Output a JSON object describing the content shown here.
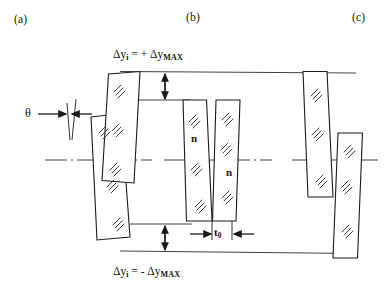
{
  "figure": {
    "kind": "technical-line-diagram",
    "background": "#ffffff",
    "line_color": "#1a1a1a"
  },
  "panels": [
    {
      "id": "a",
      "label": "(a)",
      "x": 14,
      "y": 14
    },
    {
      "id": "b",
      "label": "(b)",
      "x": 186,
      "y": 12
    },
    {
      "id": "c",
      "label": "(c)",
      "x": 352,
      "y": 12
    }
  ],
  "annotations": {
    "top_equation": {
      "text": "Δyi = + ΔyMAX",
      "delta": "Δ",
      "y_sym": "y",
      "sub_i": "i",
      "equals": "=",
      "sign": "+",
      "sub_max": "MAX",
      "x": 113,
      "y": 50
    },
    "bottom_equation": {
      "text": "Δyi = - ΔyMAX",
      "delta": "Δ",
      "y_sym": "y",
      "sub_i": "i",
      "equals": "=",
      "sign": "-",
      "sub_max": "MAX",
      "x": 113,
      "y": 267
    },
    "theta": {
      "symbol": "θ",
      "x": 27,
      "y": 111
    },
    "thickness": {
      "symbol": "t",
      "sub": "0",
      "x": 215,
      "y": 228
    },
    "n_labels": [
      {
        "text": "n",
        "x": 191,
        "y": 138
      },
      {
        "text": "n",
        "x": 227,
        "y": 172
      }
    ]
  },
  "colors": {
    "stroke": "#1a1a1a",
    "hatch": "#3a3a3a",
    "rule": "#2b2b2b",
    "background": "#ffffff"
  },
  "geometry": {
    "top_rule": {
      "x1": 120,
      "x2": 356,
      "y": 71
    },
    "bottom_rule": {
      "x1": 120,
      "x2": 356,
      "y": 252
    },
    "top_inner_rule": {
      "x1": 130,
      "x2": 190,
      "y": 100
    },
    "bottom_inner_rule": {
      "x1": 130,
      "x2": 192,
      "y": 224
    },
    "centerlines": [
      {
        "x1": 45,
        "x2": 150,
        "y": 160
      },
      {
        "x1": 165,
        "x2": 272,
        "y": 160
      },
      {
        "x1": 293,
        "x2": 381,
        "y": 160
      }
    ],
    "arrows": {
      "top_vertical": {
        "x": 165,
        "y1": 71,
        "y2": 100
      },
      "bottom_vertical": {
        "x": 165,
        "y1": 224,
        "y2": 252
      },
      "theta_left": {
        "x1": 36,
        "x2": 64,
        "y": 114
      },
      "theta_right": {
        "x1": 90,
        "x2": 70,
        "y": 114
      },
      "t0_left": {
        "x1": 190,
        "x2": 211,
        "y": 234
      },
      "t0_right": {
        "x1": 253,
        "x2": 233,
        "y": 234
      }
    }
  },
  "plates": [
    {
      "panel": "a",
      "name": "plate-a-left",
      "points": "91,117 121,113 130,237 97,240"
    },
    {
      "panel": "a",
      "name": "plate-a-right",
      "points": "108,74 140,71 134,183 102,180"
    },
    {
      "panel": "b",
      "name": "plate-b-left",
      "points": "183,100 207,100 212,221 186,221"
    },
    {
      "panel": "b",
      "name": "plate-b-right",
      "points": "216,100 240,100 236,221 212,221"
    },
    {
      "panel": "c",
      "name": "plate-c-left",
      "points": "303,71 327,71 333,197 308,197"
    },
    {
      "panel": "c",
      "name": "plate-c-right",
      "points": "338,133 363,133 358,258 333,258"
    }
  ]
}
